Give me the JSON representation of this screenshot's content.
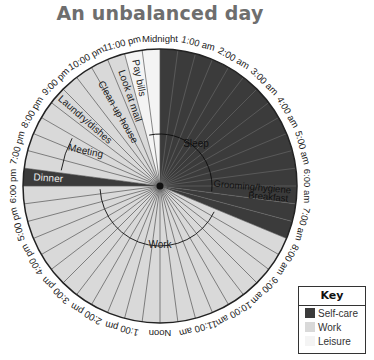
{
  "title": "An unbalanced day",
  "colors": {
    "self_care": "#3b3b3b",
    "work": "#d9d9d9",
    "leisure": "#f4f4f4",
    "divider": "#555555",
    "outline": "#222222"
  },
  "key": {
    "title": "Key",
    "items": [
      {
        "label": "Self-care",
        "color": "#3b3b3b"
      },
      {
        "label": "Work",
        "color": "#d9d9d9"
      },
      {
        "label": "Leisure",
        "color": "#f4f4f4"
      }
    ]
  },
  "hour_labels": [
    "Midnight",
    "1:00 am",
    "2:00 am",
    "3:00 am",
    "4:00 am",
    "5:00 am",
    "6:00 am",
    "7:00 am",
    "8:00 am",
    "9:00 am",
    "10:00 am",
    "11:00 am",
    "Noon",
    "1:00 pm",
    "2:00 pm",
    "3:00 pm",
    "4:00 pm",
    "5:00 pm",
    "6:00 pm",
    "7:00 pm",
    "8:00 pm",
    "9:00 pm",
    "10:00 pm",
    "11:00 pm"
  ],
  "chart_data": {
    "type": "pie",
    "title": "An unbalanced day",
    "segments": [
      {
        "label": "Sleep",
        "category": "Self-care",
        "start": 0,
        "end": 6.5
      },
      {
        "label": "Grooming/hygiene",
        "category": "Self-care",
        "start": 6.5,
        "end": 7.0
      },
      {
        "label": "Breakfast",
        "category": "Self-care",
        "start": 7.0,
        "end": 7.5
      },
      {
        "label": "Work",
        "category": "Work",
        "start": 7.5,
        "end": 18.0
      },
      {
        "label": "Dinner",
        "category": "Self-care",
        "start": 18.0,
        "end": 18.5
      },
      {
        "label": "Meeting",
        "category": "Work",
        "start": 18.5,
        "end": 20.0
      },
      {
        "label": "Laundry/dishes",
        "category": "Work",
        "start": 20.0,
        "end": 21.0
      },
      {
        "label": "Clean up house",
        "category": "Work",
        "start": 21.0,
        "end": 22.5
      },
      {
        "label": "Look at mail",
        "category": "Work",
        "start": 22.5,
        "end": 23.0
      },
      {
        "label": "Pay bills",
        "category": "Leisure",
        "start": 23.0,
        "end": 23.5
      },
      {
        "label": "",
        "category": "Leisure",
        "start": 23.5,
        "end": 24.0
      }
    ],
    "totals_hours": {
      "Self-care": 8.0,
      "Work": 15.0,
      "Leisure": 1.0
    },
    "legend": [
      "Self-care",
      "Work",
      "Leisure"
    ],
    "legend_position": "bottom-right"
  }
}
